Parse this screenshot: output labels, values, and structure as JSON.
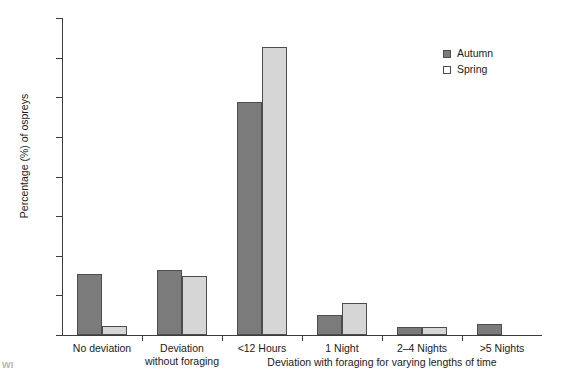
{
  "chart_data": {
    "type": "bar",
    "title": "",
    "xlabel": "Deviation with foraging for varying lengths of time",
    "ylabel": "Percentage (%) of ospreys",
    "ylim": [
      0,
      80
    ],
    "ytick_labels": [
      "80",
      "70",
      "60",
      "50",
      "40",
      "30",
      "20",
      "10",
      "0"
    ],
    "ytick_values": [
      80,
      70,
      60,
      50,
      40,
      30,
      20,
      10,
      0
    ],
    "grid": false,
    "legend_position": "top-right",
    "categories": [
      "No deviation",
      "Deviation\nwithout foraging",
      "<12 Hours",
      "1 Night",
      "2–4 Nights",
      ">5 Nights"
    ],
    "series": [
      {
        "name": "Autumn",
        "color": "#7b7b7b",
        "values": [
          15.3,
          16.3,
          58.8,
          5.1,
          1.9,
          2.9
        ]
      },
      {
        "name": "Spring",
        "color": "#d6d6d6",
        "values": [
          2.3,
          15.0,
          72.7,
          8.0,
          1.9,
          null
        ]
      }
    ]
  },
  "legend": {
    "items": [
      {
        "label": "Autumn",
        "swatch": "autumn-swatch"
      },
      {
        "label": "Spring",
        "swatch": "spring-swatch"
      }
    ]
  },
  "caption": {
    "partial_text": "wi"
  }
}
